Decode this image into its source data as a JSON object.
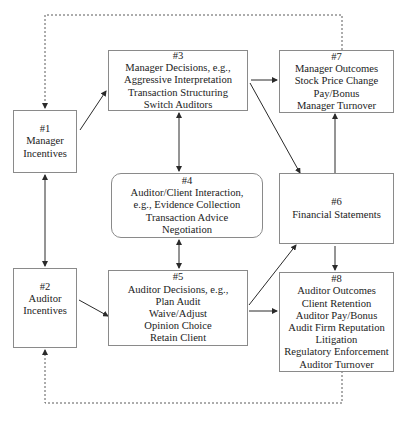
{
  "diagram": {
    "nodes": [
      {
        "id": "n1",
        "number": "#1",
        "lines": [
          "Manager",
          "Incentives"
        ]
      },
      {
        "id": "n2",
        "number": "#2",
        "lines": [
          "Auditor",
          "Incentives"
        ]
      },
      {
        "id": "n3",
        "number": "#3",
        "lines": [
          "Manager Decisions, e.g.,",
          "Aggressive Interpretation",
          "Transaction Structuring",
          "Switch Auditors"
        ]
      },
      {
        "id": "n4",
        "number": "#4",
        "lines": [
          "Auditor/Client Interaction,",
          "e.g., Evidence Collection",
          "Transaction Advice",
          "Negotiation"
        ],
        "shape": "rounded"
      },
      {
        "id": "n5",
        "number": "#5",
        "lines": [
          "Auditor Decisions, e.g.,",
          "Plan Audit",
          "Waive/Adjust",
          "Opinion Choice",
          "Retain Client"
        ]
      },
      {
        "id": "n6",
        "number": "#6",
        "lines": [
          "Financial Statements"
        ]
      },
      {
        "id": "n7",
        "number": "#7",
        "lines": [
          "Manager Outcomes",
          "Stock Price Change",
          "Pay/Bonus",
          "Manager Turnover"
        ]
      },
      {
        "id": "n8",
        "number": "#8",
        "lines": [
          "Auditor Outcomes",
          "Client Retention",
          "Auditor Pay/Bonus",
          "Audit Firm Reputation",
          "Litigation",
          "Regulatory Enforcement",
          "Auditor Turnover"
        ]
      }
    ],
    "edges": [
      {
        "from": "#1",
        "to": "#3",
        "style": "solid",
        "direction": "forward"
      },
      {
        "from": "#1",
        "to": "#2",
        "style": "solid",
        "direction": "both"
      },
      {
        "from": "#2",
        "to": "#5",
        "style": "solid",
        "direction": "forward"
      },
      {
        "from": "#3",
        "to": "#4",
        "style": "solid",
        "direction": "both"
      },
      {
        "from": "#4",
        "to": "#5",
        "style": "solid",
        "direction": "both"
      },
      {
        "from": "#3",
        "to": "#7",
        "style": "solid",
        "direction": "forward"
      },
      {
        "from": "#3",
        "to": "#6",
        "style": "solid",
        "direction": "forward"
      },
      {
        "from": "#5",
        "to": "#6",
        "style": "solid",
        "direction": "forward"
      },
      {
        "from": "#5",
        "to": "#8",
        "style": "solid",
        "direction": "forward"
      },
      {
        "from": "#6",
        "to": "#7",
        "style": "solid",
        "direction": "forward"
      },
      {
        "from": "#6",
        "to": "#8",
        "style": "solid",
        "direction": "forward"
      },
      {
        "from": "#7",
        "to": "#1",
        "style": "dashed",
        "direction": "forward"
      },
      {
        "from": "#8",
        "to": "#2",
        "style": "dashed",
        "direction": "forward"
      }
    ],
    "colors": {
      "line": "#3a3a3a",
      "border": "#8a8a8a",
      "dashed": "#5a5a5a"
    }
  }
}
